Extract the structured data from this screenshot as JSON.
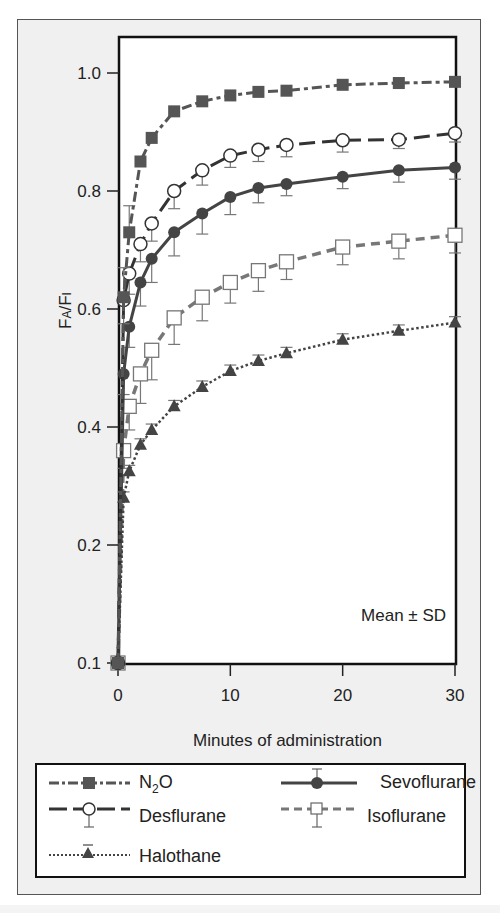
{
  "chart_data": {
    "type": "line",
    "title": "",
    "xlabel": "Minutes of administration",
    "ylabel": "FA/FI",
    "ylabel_parts": {
      "main": "F",
      "sub1": "A",
      "slash": "/F",
      "sub2": "I"
    },
    "xlim": [
      0,
      30
    ],
    "ylim": [
      0.1,
      1.0
    ],
    "x_ticks": [
      0,
      10,
      20,
      30
    ],
    "x_tick_labels": [
      "0",
      "10",
      "20",
      "30"
    ],
    "y_ticks": [
      1.0,
      0.8,
      0.6,
      0.4,
      0.2,
      0.1
    ],
    "y_tick_labels": [
      "1.0",
      "0.8",
      "0.6",
      "0.4",
      "0.2",
      "0.1"
    ],
    "y_scale_note": "0.2–1.0 linear; 0.1 placed one interval below 0.2 (axis compressed)",
    "grid": false,
    "annotation": "Mean ± SD",
    "legend_position": "below",
    "x": [
      0,
      0.5,
      1,
      2,
      3,
      5,
      7.5,
      10,
      12.5,
      15,
      20,
      25,
      30
    ],
    "series": [
      {
        "name": "N2O",
        "display": "N₂O",
        "marker": "filled-square",
        "line": "dash-dot",
        "color": "#555555",
        "values": [
          0.1,
          0.62,
          0.73,
          0.85,
          0.89,
          0.935,
          0.952,
          0.962,
          0.968,
          0.97,
          0.98,
          0.983,
          0.985
        ],
        "sd": [
          0,
          0.05,
          0.045,
          0,
          0,
          0,
          0,
          0,
          0,
          0,
          0,
          0,
          0
        ]
      },
      {
        "name": "Desflurane",
        "display": "Desflurane",
        "marker": "open-circle",
        "line": "long-dash",
        "color": "#333333",
        "values": [
          0.1,
          0.615,
          0.66,
          0.71,
          0.745,
          0.8,
          0.835,
          0.86,
          0.87,
          0.878,
          0.886,
          0.887,
          0.898
        ],
        "sd": [
          0,
          0.04,
          0.035,
          0.03,
          0.03,
          0.03,
          0.025,
          0.02,
          0.02,
          0.02,
          0.02,
          0.015,
          0.015
        ]
      },
      {
        "name": "Sevoflurane",
        "display": "Sevoflurane",
        "marker": "filled-circle",
        "line": "solid",
        "color": "#444444",
        "values": [
          0.1,
          0.49,
          0.57,
          0.645,
          0.685,
          0.73,
          0.762,
          0.79,
          0.805,
          0.812,
          0.824,
          0.835,
          0.84
        ],
        "sd": [
          0,
          0.035,
          0.035,
          0.04,
          0.04,
          0.04,
          0.035,
          0.03,
          0.025,
          0.02,
          0.02,
          0.02,
          0.02
        ]
      },
      {
        "name": "Isoflurane",
        "display": "Isoflurane",
        "marker": "open-square",
        "line": "dash",
        "color": "#777777",
        "values": [
          0.1,
          0.36,
          0.435,
          0.49,
          0.53,
          0.585,
          0.62,
          0.645,
          0.665,
          0.68,
          0.705,
          0.715,
          0.725
        ],
        "sd": [
          0,
          0.03,
          0.04,
          0.05,
          0.05,
          0.045,
          0.04,
          0.035,
          0.035,
          0.03,
          0.03,
          0.03,
          0.03
        ]
      },
      {
        "name": "Halothane",
        "display": "Halothane",
        "marker": "filled-triangle",
        "line": "dotted",
        "color": "#444444",
        "values": [
          0.1,
          0.28,
          0.325,
          0.37,
          0.395,
          0.435,
          0.468,
          0.495,
          0.512,
          0.525,
          0.548,
          0.563,
          0.577
        ],
        "sd": [
          0,
          0.01,
          0.01,
          0.01,
          0.01,
          0.01,
          0.01,
          0.01,
          0.01,
          0.01,
          0.01,
          0.01,
          0.01
        ]
      }
    ]
  },
  "legend": {
    "items": [
      {
        "label_main": "N",
        "label_sub": "2",
        "label_tail": "O"
      },
      {
        "label": "Sevoflurane"
      },
      {
        "label": "Desflurane"
      },
      {
        "label": "Isoflurane"
      },
      {
        "label": "Halothane"
      }
    ]
  }
}
